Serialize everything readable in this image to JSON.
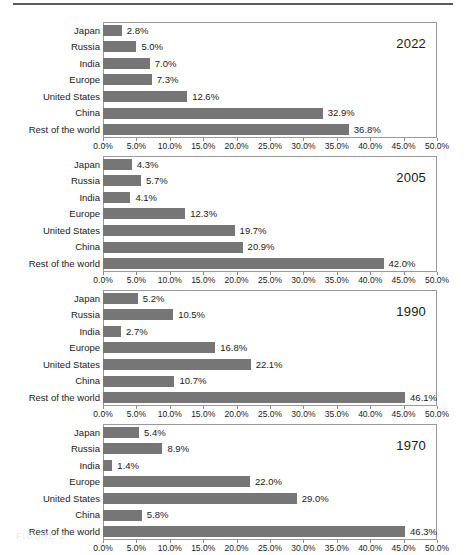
{
  "figure": {
    "caption": "FIGURE 2",
    "top_rule": true
  },
  "axis": {
    "tick_labels": [
      "0.0%",
      "5.0%",
      "10.0%",
      "15.0%",
      "20.0%",
      "25.0%",
      "30.0%",
      "35.0%",
      "40.0%",
      "45.0%",
      "50.0%"
    ],
    "min": 0,
    "max": 50,
    "step": 5
  },
  "colors": {
    "bar": "#767676",
    "frame": "#9a9a9a",
    "text": "#1a1a1a",
    "rule": "#5a5a5a"
  },
  "chart_data": {
    "type": "bar",
    "title": "",
    "xlabel": "",
    "ylabel": "",
    "xlim": [
      0,
      50
    ],
    "grid": false,
    "legend": "none",
    "orientation": "horizontal",
    "value_format": "percent-one-decimal",
    "categories": [
      "Japan",
      "Russia",
      "India",
      "Europe",
      "United States",
      "China",
      "Rest of the world"
    ],
    "panels": [
      {
        "year": "2022",
        "categories": [
          "Japan",
          "Russia",
          "India",
          "Europe",
          "United States",
          "China",
          "Rest of the world"
        ],
        "values": [
          2.8,
          5.0,
          7.0,
          7.3,
          12.6,
          32.9,
          36.8
        ],
        "labels": [
          "2.8%",
          "5.0%",
          "7.0%",
          "7.3%",
          "12.6%",
          "32.9%",
          "36.8%"
        ]
      },
      {
        "year": "2005",
        "categories": [
          "Japan",
          "Russia",
          "India",
          "Europe",
          "United States",
          "China",
          "Rest of the world"
        ],
        "values": [
          4.3,
          5.7,
          4.1,
          12.3,
          19.7,
          20.9,
          42.0
        ],
        "labels": [
          "4.3%",
          "5.7%",
          "4.1%",
          "12.3%",
          "19.7%",
          "20.9%",
          "42.0%"
        ]
      },
      {
        "year": "1990",
        "categories": [
          "Japan",
          "Russia",
          "India",
          "Europe",
          "United States",
          "China",
          "Rest of the world"
        ],
        "values": [
          5.2,
          10.5,
          2.7,
          16.8,
          22.1,
          10.7,
          46.1
        ],
        "labels": [
          "5.2%",
          "10.5%",
          "2.7%",
          "16.8%",
          "22.1%",
          "10.7%",
          "46.1%"
        ]
      },
      {
        "year": "1970",
        "categories": [
          "Japan",
          "Russia",
          "India",
          "Europe",
          "United States",
          "China",
          "Rest of the world"
        ],
        "values": [
          5.4,
          8.9,
          1.4,
          22.0,
          29.0,
          5.8,
          46.3
        ],
        "labels": [
          "5.4%",
          "8.9%",
          "1.4%",
          "22.0%",
          "29.0%",
          "5.8%",
          "46.3%"
        ]
      }
    ]
  }
}
